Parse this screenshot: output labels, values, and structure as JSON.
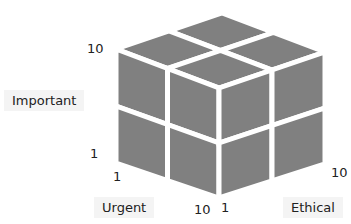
{
  "diagram": {
    "title": "",
    "type": "3d-cube-matrix",
    "grid": "2x2x2",
    "face_color": "#808080",
    "gap_color": "#ffffff",
    "axes": {
      "vertical": {
        "label": "Important",
        "min": "1",
        "max": "10"
      },
      "left": {
        "label": "Urgent",
        "min": "1",
        "max": "10"
      },
      "right": {
        "label": "Ethical",
        "min": "1",
        "max": "10"
      }
    }
  }
}
